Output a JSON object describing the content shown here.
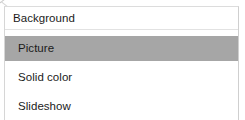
{
  "panel": {
    "header": {
      "label": "Background"
    },
    "options": [
      {
        "label": "Picture",
        "selected": true
      },
      {
        "label": "Solid color",
        "selected": false
      },
      {
        "label": "Slideshow",
        "selected": false
      }
    ]
  },
  "colors": {
    "panel_background": "#ffffff",
    "text": "#1b1b1b",
    "selection_highlight": "#a6a6a6",
    "border": "#d6d6d6",
    "separator": "#e2e2e2"
  },
  "icons": {
    "cursor_artifact": "cursor-arrow-icon"
  }
}
